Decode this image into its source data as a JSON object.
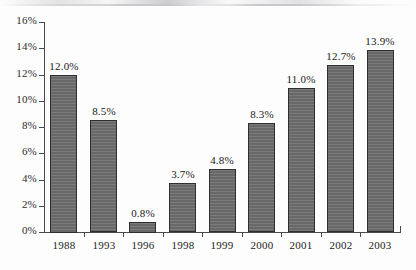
{
  "chart_data": {
    "type": "bar",
    "title": "",
    "subtitle": "",
    "xlabel": "",
    "ylabel": "",
    "categories": [
      "1988",
      "1993",
      "1996",
      "1998",
      "1999",
      "2000",
      "2001",
      "2002",
      "2003"
    ],
    "values": [
      12.0,
      8.5,
      0.8,
      3.7,
      4.8,
      8.3,
      11.0,
      12.7,
      13.9
    ],
    "value_labels": [
      "12.0%",
      "8.5%",
      "0.8%",
      "3.7%",
      "4.8%",
      "8.3%",
      "11.0%",
      "12.7%",
      "13.9%"
    ],
    "series": [
      {
        "name": "",
        "values": [
          12.0,
          8.5,
          0.8,
          3.7,
          4.8,
          8.3,
          11.0,
          12.7,
          13.9
        ]
      }
    ],
    "ylim": [
      0,
      16
    ],
    "ytick_values": [
      0,
      2,
      4,
      6,
      8,
      10,
      12,
      14,
      16
    ],
    "ytick_labels": [
      "0%",
      "2%",
      "4%",
      "6%",
      "8%",
      "10%",
      "12%",
      "14%",
      "16%"
    ],
    "grid": false,
    "legend": false,
    "legend_position": "none",
    "bar_color": "#6e6e6e",
    "bar_border_color": "#2e2e2e",
    "axis_color": "#4a4a4a",
    "background_color": "#fdfdfd",
    "text_color": "#232323",
    "data_labels_shown": true,
    "data_label_position": "above-bar"
  }
}
